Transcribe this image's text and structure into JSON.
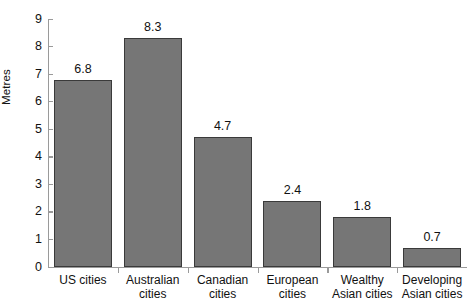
{
  "chart_data": {
    "type": "bar",
    "title": "",
    "xlabel": "",
    "ylabel": "Metres",
    "categories": [
      "US cities",
      "Australian cities",
      "Canadian cities",
      "European cities",
      "Wealthy Asian cities",
      "Developing Asian cities"
    ],
    "category_lines": [
      [
        "US cities",
        ""
      ],
      [
        "Australian",
        "cities"
      ],
      [
        "Canadian",
        "cities"
      ],
      [
        "European",
        "cities"
      ],
      [
        "Wealthy",
        "Asian cities"
      ],
      [
        "Developing",
        "Asian cities"
      ]
    ],
    "values": [
      6.8,
      8.3,
      4.7,
      2.4,
      1.8,
      0.7
    ],
    "value_labels": [
      "6.8",
      "8.3",
      "4.7",
      "2.4",
      "1.8",
      "0.7"
    ],
    "ylim": [
      0,
      9
    ],
    "ytick_labels": [
      "0",
      "1",
      "2",
      "3",
      "4",
      "5",
      "6",
      "7",
      "8",
      "9"
    ],
    "grid": false,
    "legend": false,
    "bar_color": "#767676",
    "bar_edge_color": "#3a3a3a",
    "axis_color": "#9a9a9a",
    "background": "#ffffff"
  }
}
